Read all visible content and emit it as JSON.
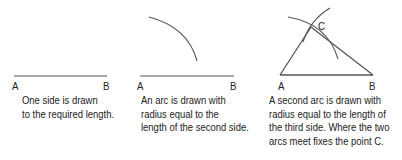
{
  "panels": [
    {
      "id": "step1",
      "labels": {
        "a": "A",
        "b": "B"
      },
      "caption": [
        "One side is drawn",
        "to the required length."
      ]
    },
    {
      "id": "step2",
      "labels": {
        "a": "A",
        "b": "B"
      },
      "caption": [
        "An arc is drawn with",
        "radius equal to the",
        "length of the second side."
      ]
    },
    {
      "id": "step3",
      "labels": {
        "a": "A",
        "b": "B",
        "c": "C"
      },
      "caption": [
        "A second arc is drawn with",
        "radius equal to the length of",
        "the third side. Where the two",
        "arcs meet fixes the point C."
      ]
    }
  ],
  "colors": {
    "line": "#8a8a8a",
    "arc": "#555555",
    "text": "#222222"
  }
}
